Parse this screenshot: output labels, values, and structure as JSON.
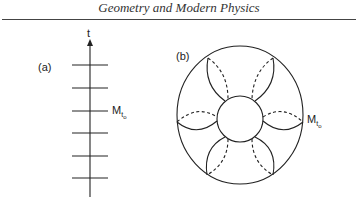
{
  "page": {
    "running_head": "Geometry and Modern Physics"
  },
  "figure": {
    "panel_a": {
      "label": "(a)",
      "axis_label": "t",
      "slice_label_main": "M",
      "slice_label_sub": "t",
      "slice_label_subsub": "o",
      "slice_count": 6
    },
    "panel_b": {
      "label": "(b)",
      "slice_label_main": "M",
      "slice_label_sub": "t",
      "slice_label_subsub": "o",
      "petal_count": 6
    }
  },
  "colors": {
    "ink": "#222222",
    "rule": "#444444"
  }
}
